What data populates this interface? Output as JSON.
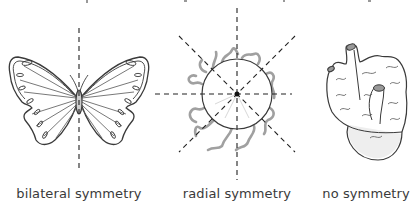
{
  "figure": {
    "panels": [
      {
        "id": "bilateral",
        "label": "bilateral symmetry",
        "subject": "butterfly",
        "symmetry_lines": 1
      },
      {
        "id": "radial",
        "label": "radial symmetry",
        "subject": "sea anemone (top view)",
        "symmetry_lines": 4
      },
      {
        "id": "none",
        "label": "no symmetry",
        "subject": "sponge",
        "symmetry_lines": 0
      }
    ]
  },
  "colors": {
    "line": "#333333",
    "tentacle": "#9a9a9a",
    "dash": "#222222",
    "label": "#3a3a3a",
    "fill_light": "#f1f1f1"
  }
}
